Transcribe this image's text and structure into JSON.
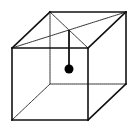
{
  "diagram": {
    "type": "wireframe-cube-with-pendulum",
    "colors": {
      "background": "#ffffff",
      "stroke": "#111111",
      "hidden_stroke": "#333333",
      "ball": "#000000"
    },
    "vertices": {
      "front_top_left": [
        12,
        48
      ],
      "front_top_right": [
        88,
        48
      ],
      "front_bottom_left": [
        12,
        120
      ],
      "front_bottom_right": [
        88,
        120
      ],
      "back_top_left": [
        50,
        12
      ],
      "back_top_right": [
        126,
        12
      ],
      "back_bottom_left": [
        50,
        84
      ],
      "back_bottom_right": [
        126,
        84
      ]
    },
    "visible_edges": [
      [
        "front_top_left",
        "front_top_right"
      ],
      [
        "front_top_right",
        "front_bottom_right"
      ],
      [
        "front_bottom_right",
        "front_bottom_left"
      ],
      [
        "front_bottom_left",
        "front_top_left"
      ],
      [
        "front_top_left",
        "back_top_left"
      ],
      [
        "back_top_left",
        "back_top_right"
      ],
      [
        "back_top_right",
        "front_top_right"
      ],
      [
        "back_top_right",
        "back_bottom_right"
      ],
      [
        "back_bottom_right",
        "front_bottom_right"
      ]
    ],
    "hidden_edges": [
      [
        "back_top_left",
        "back_bottom_left"
      ],
      [
        "back_bottom_left",
        "back_bottom_right"
      ],
      [
        "back_bottom_left",
        "front_bottom_left"
      ]
    ],
    "top_face_diagonals": [
      [
        "back_top_left",
        "front_top_right"
      ],
      [
        "front_top_left",
        "back_top_right"
      ]
    ],
    "pendulum": {
      "pivot": [
        69,
        30
      ],
      "bob_center": [
        69,
        69
      ],
      "bob_radius": 4.5
    }
  }
}
